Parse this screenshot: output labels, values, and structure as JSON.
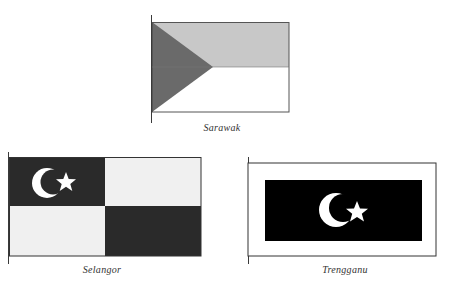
{
  "flags": [
    {
      "name": "Sarawak",
      "caption": "Sarawak",
      "colors": {
        "top_band": "#c8c8c8",
        "bottom_band": "#ffffff",
        "triangle": "#6a6a6a",
        "border": "#555555"
      }
    },
    {
      "name": "Selangor",
      "caption": "Selangor",
      "colors": {
        "dark_quadrant": "#2a2a2a",
        "light_quadrant": "#f0f0f0",
        "emblem": "#ffffff",
        "border": "#333333"
      },
      "emblem": "crescent-and-star"
    },
    {
      "name": "Trengganu",
      "caption": "Trengganu",
      "colors": {
        "outer_border_field": "#ffffff",
        "inner_field": "#000000",
        "emblem": "#ffffff",
        "border": "#333333"
      },
      "emblem": "crescent-and-star"
    }
  ]
}
